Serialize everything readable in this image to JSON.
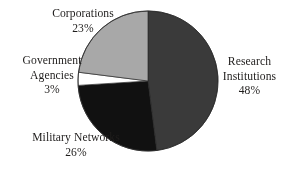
{
  "chart_data": {
    "type": "pie",
    "title": "",
    "subtitle": "",
    "xlabel": "",
    "ylabel": "",
    "legend_position": "none",
    "grid": false,
    "start_angle_deg": 0,
    "direction": "clockwise",
    "units": "percent",
    "total": 100,
    "categories": [
      "Research Institutions",
      "Military Networks",
      "Government Agencies",
      "Corporations"
    ],
    "values": [
      48,
      26,
      3,
      23
    ],
    "slices": [
      {
        "label": "Research Institutions",
        "label_line_1": "Research",
        "label_line_2": "Institutions",
        "value": 48,
        "value_text": "48%",
        "color": "#3a3a3a",
        "start_deg": 0,
        "end_deg": 172.8
      },
      {
        "label": "Military Networks",
        "label_line_1": "Military Networks",
        "label_line_2": "",
        "value": 26,
        "value_text": "26%",
        "color": "#111111",
        "start_deg": 172.8,
        "end_deg": 266.4
      },
      {
        "label": "Government Agencies",
        "label_line_1": "Government",
        "label_line_2": "Agencies",
        "value": 3,
        "value_text": "3%",
        "color": "#ffffff",
        "start_deg": 266.4,
        "end_deg": 277.2
      },
      {
        "label": "Corporations",
        "label_line_1": "Corporations",
        "label_line_2": "",
        "value": 23,
        "value_text": "23%",
        "color": "#a8a8a8",
        "start_deg": 277.2,
        "end_deg": 360
      }
    ],
    "geometry": {
      "center_x": 148,
      "center_y": 81,
      "radius": 70
    },
    "colors": {
      "background": "#ffffff",
      "text": "#1f1d1c",
      "outline": "#2b2b2b",
      "research_institutions": "#3a3a3a",
      "military_networks": "#111111",
      "government_agencies": "#ffffff",
      "corporations": "#a8a8a8"
    }
  }
}
